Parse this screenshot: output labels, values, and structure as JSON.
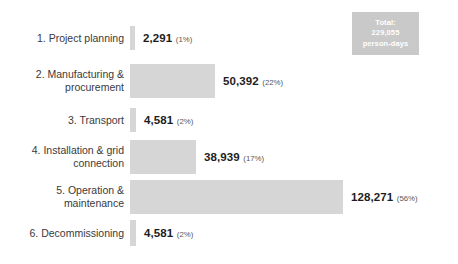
{
  "total_badge": {
    "label": "Total:",
    "value": "229,055",
    "unit": "person-days",
    "bg_color": "#c9c9c9",
    "text_color": "#ffffff"
  },
  "style": {
    "bar_color": "#d6d6d6",
    "label_color": "#3a3a3a",
    "value_color": "#1d1d1d",
    "percent_color": "#575757",
    "background": "#ffffff"
  },
  "chart_data": {
    "type": "bar",
    "orientation": "horizontal",
    "title": "",
    "subtitle": "",
    "xlabel": "",
    "ylabel": "",
    "grid": false,
    "legend": "none",
    "unit": "person-days",
    "total": 229055,
    "total_label": "Total: 229,055 person-days",
    "categories": [
      "1. Project planning",
      "2. Manufacturing &\nprocurement",
      "3. Transport",
      "4. Installation & grid\nconnection",
      "5. Operation &\nmaintenance",
      "6. Decommissioning"
    ],
    "values": [
      2291,
      50392,
      4581,
      38939,
      128271,
      4581
    ],
    "value_labels": [
      "2,291",
      "50,392",
      "4,581",
      "38,939",
      "128,271",
      "4,581"
    ],
    "percents": [
      1,
      22,
      2,
      17,
      56,
      2
    ],
    "percent_labels": [
      "(1%)",
      "(22%)",
      "(2%)",
      "(17%)",
      "(56%)",
      "(2%)"
    ],
    "xlim": [
      0,
      128271
    ]
  },
  "rows": [
    {
      "label": "1. Project planning",
      "value_label": "2,291",
      "percent_label": "(1%)",
      "bar_width_px": 5,
      "bar_height_px": 24
    },
    {
      "label": "2. Manufacturing &\nprocurement",
      "value_label": "50,392",
      "percent_label": "(22%)",
      "bar_width_px": 85,
      "bar_height_px": 34
    },
    {
      "label": "3. Transport",
      "value_label": "4,581",
      "percent_label": "(2%)",
      "bar_width_px": 6,
      "bar_height_px": 24
    },
    {
      "label": "4. Installation & grid\nconnection",
      "value_label": "38,939",
      "percent_label": "(17%)",
      "bar_width_px": 66,
      "bar_height_px": 34
    },
    {
      "label": "5. Operation &\nmaintenance",
      "value_label": "128,271",
      "percent_label": "(56%)",
      "bar_width_px": 213,
      "bar_height_px": 34
    },
    {
      "label": "6. Decommissioning",
      "value_label": "4,581",
      "percent_label": "(2%)",
      "bar_width_px": 6,
      "bar_height_px": 26
    }
  ]
}
